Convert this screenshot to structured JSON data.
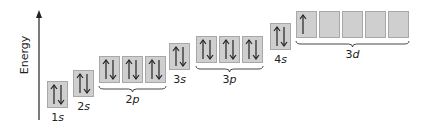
{
  "axis": {
    "label": "Energy"
  },
  "orbitals": [
    {
      "name": "1s",
      "num": "1",
      "sub": "s",
      "x": 47,
      "y": 81,
      "boxes": [
        [
          "up",
          "down"
        ]
      ]
    },
    {
      "name": "2s",
      "num": "2",
      "sub": "s",
      "x": 73,
      "y": 70,
      "boxes": [
        [
          "up",
          "down"
        ]
      ]
    },
    {
      "name": "2p",
      "num": "2",
      "sub": "p",
      "x": 99,
      "y": 56,
      "boxes": [
        [
          "up",
          "down"
        ],
        [
          "up",
          "down"
        ],
        [
          "up",
          "down"
        ]
      ]
    },
    {
      "name": "3s",
      "num": "3",
      "sub": "s",
      "x": 169,
      "y": 43,
      "boxes": [
        [
          "up",
          "down"
        ]
      ]
    },
    {
      "name": "3p",
      "num": "3",
      "sub": "p",
      "x": 196,
      "y": 36,
      "boxes": [
        [
          "up",
          "down"
        ],
        [
          "up",
          "down"
        ],
        [
          "up",
          "down"
        ]
      ]
    },
    {
      "name": "4s",
      "num": "4",
      "sub": "s",
      "x": 270,
      "y": 23,
      "boxes": [
        [
          "up",
          "down"
        ]
      ]
    },
    {
      "name": "3d",
      "num": "3",
      "sub": "d",
      "x": 296,
      "y": 11,
      "boxes": [
        [
          "up"
        ],
        [],
        [],
        [],
        []
      ]
    }
  ],
  "colors": {
    "box_fill": "#cfcfcf",
    "box_border": "#a8a8a8",
    "arrow": "#222222"
  }
}
